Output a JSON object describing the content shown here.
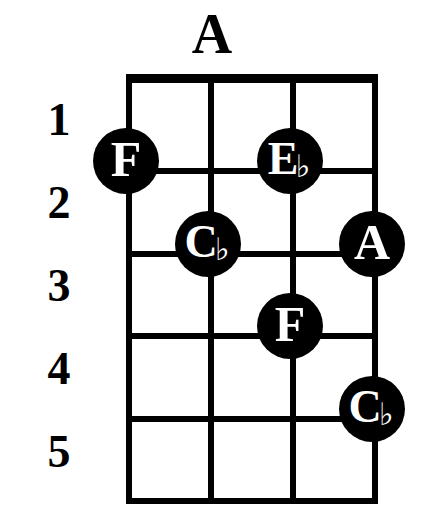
{
  "title": "A",
  "instrument": "ukulele",
  "colors": {
    "ink": "#000000",
    "paper": "#ffffff",
    "marker_fill": "#000000",
    "marker_text": "#ffffff"
  },
  "fret_numbers": [
    "1",
    "2",
    "3",
    "4",
    "5"
  ],
  "grid": {
    "string_count": 4,
    "fret_count": 5,
    "has_nut": true
  },
  "chart_data": {
    "type": "table",
    "title": "A",
    "xlabel": "strings",
    "ylabel": "frets",
    "categories": [
      "string 1",
      "string 2",
      "string 3",
      "string 4"
    ],
    "tick_labels": [
      "1",
      "2",
      "3",
      "4",
      "5"
    ],
    "grid": true,
    "legend": "none",
    "notes": [
      {
        "label": "F",
        "accidental": "",
        "base": "F",
        "string": 1,
        "fret": 1
      },
      {
        "label": "Eb",
        "accidental": "♭",
        "base": "E",
        "string": 3,
        "fret": 1
      },
      {
        "label": "Cb",
        "accidental": "♭",
        "base": "C",
        "string": 2,
        "fret": 2
      },
      {
        "label": "A",
        "accidental": "",
        "base": "A",
        "string": 4,
        "fret": 2
      },
      {
        "label": "F",
        "accidental": "",
        "base": "F",
        "string": 3,
        "fret": 3
      },
      {
        "label": "Cb",
        "accidental": "♭",
        "base": "C",
        "string": 4,
        "fret": 4
      }
    ]
  }
}
